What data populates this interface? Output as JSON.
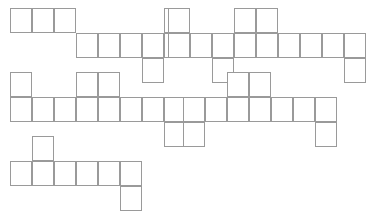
{
  "page": {
    "background_color": "#ffffff",
    "line_color": "#9a9a9a",
    "fill_color": "#ffffff",
    "width": 339,
    "height": 198
  },
  "grid": {
    "cell_width": 22,
    "cell_height": 25,
    "stroke_width": 1
  },
  "shapes": [
    {
      "name": "net-1",
      "label": "",
      "origin_x": 10,
      "origin_y": 8,
      "cell_count": 8,
      "cells": [
        {
          "col": 0,
          "row": 0
        },
        {
          "col": 1,
          "row": 0
        },
        {
          "col": 2,
          "row": 0
        },
        {
          "col": 3,
          "row": 1
        },
        {
          "col": 4,
          "row": 1
        },
        {
          "col": 5,
          "row": 1
        },
        {
          "col": 6,
          "row": 1
        },
        {
          "col": 6,
          "row": 2
        },
        {
          "col": 7,
          "row": 0
        },
        {
          "col": 7,
          "row": 1
        }
      ]
    },
    {
      "name": "net-2",
      "label": "",
      "origin_x": 168,
      "origin_y": 8,
      "cell_count": 11,
      "cells": [
        {
          "col": 0,
          "row": 0
        },
        {
          "col": 0,
          "row": 1
        },
        {
          "col": 1,
          "row": 1
        },
        {
          "col": 2,
          "row": 1
        },
        {
          "col": 2,
          "row": 2
        },
        {
          "col": 3,
          "row": 0
        },
        {
          "col": 3,
          "row": 1
        },
        {
          "col": 4,
          "row": 0
        },
        {
          "col": 4,
          "row": 1
        },
        {
          "col": 5,
          "row": 1
        },
        {
          "col": 6,
          "row": 1
        },
        {
          "col": 7,
          "row": 1
        },
        {
          "col": 8,
          "row": 1
        },
        {
          "col": 8,
          "row": 2
        }
      ]
    },
    {
      "name": "net-3",
      "label": "",
      "origin_x": 10,
      "origin_y": 72,
      "cell_count": 10,
      "cells": [
        {
          "col": 0,
          "row": 0
        },
        {
          "col": 0,
          "row": 1
        },
        {
          "col": 1,
          "row": 1
        },
        {
          "col": 2,
          "row": 1
        },
        {
          "col": 3,
          "row": 0
        },
        {
          "col": 3,
          "row": 1
        },
        {
          "col": 4,
          "row": 0
        },
        {
          "col": 4,
          "row": 1
        },
        {
          "col": 5,
          "row": 1
        },
        {
          "col": 6,
          "row": 1
        },
        {
          "col": 7,
          "row": 1
        },
        {
          "col": 7,
          "row": 2
        }
      ]
    },
    {
      "name": "net-4",
      "label": "",
      "origin_x": 183,
      "origin_y": 72,
      "cell_count": 9,
      "cells": [
        {
          "col": 0,
          "row": 1
        },
        {
          "col": 0,
          "row": 2
        },
        {
          "col": 1,
          "row": 1
        },
        {
          "col": 2,
          "row": 0
        },
        {
          "col": 2,
          "row": 1
        },
        {
          "col": 3,
          "row": 0
        },
        {
          "col": 3,
          "row": 1
        },
        {
          "col": 4,
          "row": 1
        },
        {
          "col": 5,
          "row": 1
        },
        {
          "col": 6,
          "row": 1
        },
        {
          "col": 6,
          "row": 2
        }
      ]
    },
    {
      "name": "net-5",
      "label": "",
      "origin_x": 10,
      "origin_y": 136,
      "cell_count": 8,
      "cells": [
        {
          "col": 0,
          "row": 1
        },
        {
          "col": 1,
          "row": 0
        },
        {
          "col": 1,
          "row": 1
        },
        {
          "col": 2,
          "row": 1
        },
        {
          "col": 3,
          "row": 1
        },
        {
          "col": 4,
          "row": 1
        },
        {
          "col": 5,
          "row": 1
        },
        {
          "col": 5,
          "row": 2
        }
      ]
    }
  ]
}
